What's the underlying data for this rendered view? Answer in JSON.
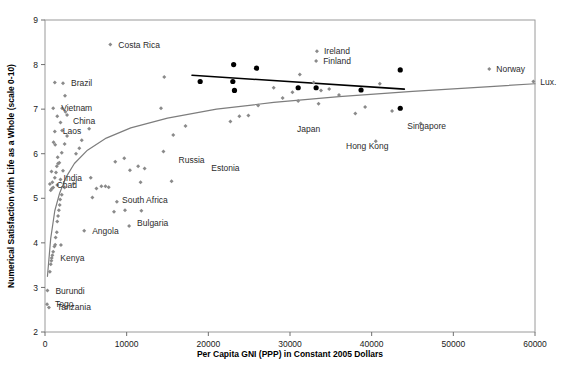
{
  "chart_data": {
    "type": "scatter",
    "title": "",
    "xlabel": "Per Capita GNI (PPP) in Constant 2005 Dollars",
    "ylabel": "Numerical Satisfaction with Life as a Whole (scale 0-10)",
    "xlim": [
      0,
      60000
    ],
    "ylim": [
      2,
      9
    ],
    "xticks": [
      0,
      10000,
      20000,
      30000,
      40000,
      50000,
      60000
    ],
    "xtick_labels": [
      "0",
      "10000",
      "20000",
      "30000",
      "40000",
      "50000",
      "60000"
    ],
    "yticks": [
      2,
      3,
      4,
      5,
      6,
      7,
      8,
      9
    ],
    "ytick_labels": [
      "2",
      "3",
      "4",
      "5",
      "6",
      "7",
      "8",
      "9"
    ],
    "grid": false,
    "legend": "none",
    "colors": {
      "grey_point": "#8a8a8a",
      "black_point": "#000000",
      "grey_fit": "#7d7d7d",
      "black_fit": "#000000",
      "axis": "#9a9a9a",
      "text": "#1a1a1a"
    },
    "series": [
      {
        "name": "All countries",
        "marker": "grey-diamond",
        "points": [
          {
            "x": 250,
            "y": 2.62
          },
          {
            "x": 480,
            "y": 2.55
          },
          {
            "x": 300,
            "y": 2.93
          },
          {
            "x": 600,
            "y": 3.35
          },
          {
            "x": 700,
            "y": 3.52
          },
          {
            "x": 780,
            "y": 3.6
          },
          {
            "x": 820,
            "y": 3.66
          },
          {
            "x": 900,
            "y": 3.72
          },
          {
            "x": 1000,
            "y": 3.8
          },
          {
            "x": 1150,
            "y": 3.92
          },
          {
            "x": 1250,
            "y": 3.96
          },
          {
            "x": 1950,
            "y": 3.95
          },
          {
            "x": 1300,
            "y": 4.12
          },
          {
            "x": 1450,
            "y": 4.24
          },
          {
            "x": 4800,
            "y": 4.27
          },
          {
            "x": 1500,
            "y": 4.48
          },
          {
            "x": 10300,
            "y": 4.38
          },
          {
            "x": 1600,
            "y": 4.6
          },
          {
            "x": 1700,
            "y": 4.73
          },
          {
            "x": 8450,
            "y": 4.7
          },
          {
            "x": 9800,
            "y": 4.73
          },
          {
            "x": 11800,
            "y": 4.72
          },
          {
            "x": 1800,
            "y": 4.85
          },
          {
            "x": 8800,
            "y": 4.92
          },
          {
            "x": 1850,
            "y": 4.97
          },
          {
            "x": 5800,
            "y": 5.02
          },
          {
            "x": 2050,
            "y": 5.08
          },
          {
            "x": 700,
            "y": 5.18
          },
          {
            "x": 850,
            "y": 5.22
          },
          {
            "x": 1000,
            "y": 5.24
          },
          {
            "x": 2400,
            "y": 5.24
          },
          {
            "x": 6300,
            "y": 5.22
          },
          {
            "x": 6900,
            "y": 5.27
          },
          {
            "x": 7400,
            "y": 5.27
          },
          {
            "x": 7800,
            "y": 5.25
          },
          {
            "x": 600,
            "y": 5.32
          },
          {
            "x": 900,
            "y": 5.36
          },
          {
            "x": 1500,
            "y": 5.3
          },
          {
            "x": 3500,
            "y": 5.33
          },
          {
            "x": 11700,
            "y": 5.36
          },
          {
            "x": 15500,
            "y": 5.38
          },
          {
            "x": 1200,
            "y": 5.46
          },
          {
            "x": 1900,
            "y": 5.42
          },
          {
            "x": 5600,
            "y": 5.46
          },
          {
            "x": 800,
            "y": 5.6
          },
          {
            "x": 1350,
            "y": 5.58
          },
          {
            "x": 2200,
            "y": 5.62
          },
          {
            "x": 10400,
            "y": 5.63
          },
          {
            "x": 12200,
            "y": 5.67
          },
          {
            "x": 1450,
            "y": 5.72
          },
          {
            "x": 1600,
            "y": 5.78
          },
          {
            "x": 1750,
            "y": 5.8
          },
          {
            "x": 8600,
            "y": 5.82
          },
          {
            "x": 11400,
            "y": 5.72
          },
          {
            "x": 1550,
            "y": 5.92
          },
          {
            "x": 9700,
            "y": 5.9
          },
          {
            "x": 2050,
            "y": 6.02
          },
          {
            "x": 3800,
            "y": 6.0
          },
          {
            "x": 14500,
            "y": 6.05
          },
          {
            "x": 4200,
            "y": 6.12
          },
          {
            "x": 1250,
            "y": 6.2
          },
          {
            "x": 2400,
            "y": 6.22
          },
          {
            "x": 40500,
            "y": 6.28
          },
          {
            "x": 1050,
            "y": 6.26
          },
          {
            "x": 4500,
            "y": 6.3
          },
          {
            "x": 2700,
            "y": 6.4
          },
          {
            "x": 15700,
            "y": 6.42
          },
          {
            "x": 1200,
            "y": 6.5
          },
          {
            "x": 2100,
            "y": 6.52
          },
          {
            "x": 5400,
            "y": 6.56
          },
          {
            "x": 17200,
            "y": 6.62
          },
          {
            "x": 46000,
            "y": 6.68
          },
          {
            "x": 1900,
            "y": 6.7
          },
          {
            "x": 22700,
            "y": 6.72
          },
          {
            "x": 1500,
            "y": 6.84
          },
          {
            "x": 23800,
            "y": 6.84
          },
          {
            "x": 24900,
            "y": 6.86
          },
          {
            "x": 2700,
            "y": 6.87
          },
          {
            "x": 38000,
            "y": 6.9
          },
          {
            "x": 2500,
            "y": 6.94
          },
          {
            "x": 42500,
            "y": 6.96
          },
          {
            "x": 1000,
            "y": 7.02
          },
          {
            "x": 2100,
            "y": 7.02
          },
          {
            "x": 14200,
            "y": 7.02
          },
          {
            "x": 39200,
            "y": 7.05
          },
          {
            "x": 26100,
            "y": 7.08
          },
          {
            "x": 2450,
            "y": 7.3
          },
          {
            "x": 33500,
            "y": 7.12
          },
          {
            "x": 31000,
            "y": 7.18
          },
          {
            "x": 29100,
            "y": 7.25
          },
          {
            "x": 36000,
            "y": 7.32
          },
          {
            "x": 30300,
            "y": 7.38
          },
          {
            "x": 33800,
            "y": 7.42
          },
          {
            "x": 34800,
            "y": 7.45
          },
          {
            "x": 28000,
            "y": 7.48
          },
          {
            "x": 2200,
            "y": 7.58
          },
          {
            "x": 1200,
            "y": 7.6
          },
          {
            "x": 41000,
            "y": 7.57
          },
          {
            "x": 32900,
            "y": 7.6
          },
          {
            "x": 14600,
            "y": 7.72
          },
          {
            "x": 31200,
            "y": 7.78
          },
          {
            "x": 54400,
            "y": 7.9
          },
          {
            "x": 33200,
            "y": 8.08
          },
          {
            "x": 33300,
            "y": 8.3
          },
          {
            "x": 8000,
            "y": 8.45
          },
          {
            "x": 59800,
            "y": 7.62
          }
        ]
      },
      {
        "name": "Highlighted (dark) countries",
        "marker": "black-circle",
        "points": [
          {
            "x": 19000,
            "y": 7.62
          },
          {
            "x": 23000,
            "y": 7.62
          },
          {
            "x": 23100,
            "y": 8.0
          },
          {
            "x": 23200,
            "y": 7.42
          },
          {
            "x": 25900,
            "y": 7.92
          },
          {
            "x": 31000,
            "y": 7.48
          },
          {
            "x": 33200,
            "y": 7.48
          },
          {
            "x": 38700,
            "y": 7.43
          },
          {
            "x": 43500,
            "y": 7.88
          },
          {
            "x": 43500,
            "y": 7.02
          }
        ]
      }
    ],
    "fit_lines": [
      {
        "name": "logarithmic-fit-all-countries",
        "style": "grey-curve",
        "points": [
          {
            "x": 300,
            "y": 3.25
          },
          {
            "x": 700,
            "y": 4.1
          },
          {
            "x": 1200,
            "y": 4.72
          },
          {
            "x": 1800,
            "y": 5.12
          },
          {
            "x": 2600,
            "y": 5.48
          },
          {
            "x": 3600,
            "y": 5.78
          },
          {
            "x": 5200,
            "y": 6.08
          },
          {
            "x": 7500,
            "y": 6.35
          },
          {
            "x": 10500,
            "y": 6.58
          },
          {
            "x": 15000,
            "y": 6.8
          },
          {
            "x": 21000,
            "y": 7.0
          },
          {
            "x": 28000,
            "y": 7.15
          },
          {
            "x": 36000,
            "y": 7.28
          },
          {
            "x": 45000,
            "y": 7.4
          },
          {
            "x": 54000,
            "y": 7.5
          },
          {
            "x": 60000,
            "y": 7.57
          }
        ]
      },
      {
        "name": "linear-fit-rich-countries",
        "style": "black-line",
        "points": [
          {
            "x": 18000,
            "y": 7.76
          },
          {
            "x": 44000,
            "y": 7.45
          }
        ]
      }
    ],
    "annotations": [
      {
        "label": "Costa Rica",
        "x": 8000,
        "y": 8.45,
        "anchor": "start",
        "dx": 8,
        "dy": 3
      },
      {
        "label": "Ireland",
        "x": 33300,
        "y": 8.3,
        "anchor": "start",
        "dx": 7,
        "dy": 3
      },
      {
        "label": "Finland",
        "x": 33200,
        "y": 8.08,
        "anchor": "start",
        "dx": 7,
        "dy": 3
      },
      {
        "label": "Norway",
        "x": 54400,
        "y": 7.9,
        "anchor": "start",
        "dx": 7,
        "dy": 3
      },
      {
        "label": "Brazil",
        "x": 2200,
        "y": 7.58,
        "anchor": "start",
        "dx": 8,
        "dy": 3
      },
      {
        "label": "Lux.",
        "x": 59800,
        "y": 7.62,
        "anchor": "start",
        "dx": 7,
        "dy": 3
      },
      {
        "label": "Vietnam",
        "x": 1000,
        "y": 7.02,
        "anchor": "start",
        "dx": 8,
        "dy": 3
      },
      {
        "label": "China",
        "x": 2450,
        "y": 6.87,
        "anchor": "start",
        "dx": 8,
        "dy": 9
      },
      {
        "label": "Japan",
        "x": 30000,
        "y": 6.55,
        "anchor": "start",
        "dx": 7,
        "dy": 3
      },
      {
        "label": "Singapore",
        "x": 43500,
        "y": 6.62,
        "anchor": "start",
        "dx": 7,
        "dy": 3
      },
      {
        "label": "Laos",
        "x": 1200,
        "y": 6.5,
        "anchor": "start",
        "dx": 8,
        "dy": 3
      },
      {
        "label": "Hong Kong",
        "x": 36000,
        "y": 6.18,
        "anchor": "start",
        "dx": 7,
        "dy": 3
      },
      {
        "label": "Russia",
        "x": 15500,
        "y": 5.85,
        "anchor": "start",
        "dx": 7,
        "dy": 3
      },
      {
        "label": "Estonia",
        "x": 19500,
        "y": 5.68,
        "anchor": "start",
        "dx": 7,
        "dy": 3
      },
      {
        "label": "India",
        "x": 1300,
        "y": 5.46,
        "anchor": "start",
        "dx": 8,
        "dy": 3
      },
      {
        "label": "Chad",
        "x": 450,
        "y": 5.3,
        "anchor": "start",
        "dx": 8,
        "dy": 3
      },
      {
        "label": "South Africa",
        "x": 8450,
        "y": 4.97,
        "anchor": "start",
        "dx": 8,
        "dy": 3
      },
      {
        "label": "Bulgaria",
        "x": 10300,
        "y": 4.45,
        "anchor": "start",
        "dx": 8,
        "dy": 3
      },
      {
        "label": "Angola",
        "x": 4800,
        "y": 4.27,
        "anchor": "start",
        "dx": 8,
        "dy": 3
      },
      {
        "label": "Kenya",
        "x": 900,
        "y": 3.66,
        "anchor": "start",
        "dx": 8,
        "dy": 3
      },
      {
        "label": "Burundi",
        "x": 300,
        "y": 2.93,
        "anchor": "start",
        "dx": 8,
        "dy": 3
      },
      {
        "label": "Togo",
        "x": 250,
        "y": 2.62,
        "anchor": "start",
        "dx": 8,
        "dy": 3
      },
      {
        "label": "Tanzania",
        "x": 480,
        "y": 2.55,
        "anchor": "start",
        "dx": 8,
        "dy": 3
      }
    ]
  },
  "caption": {
    "text": ""
  }
}
